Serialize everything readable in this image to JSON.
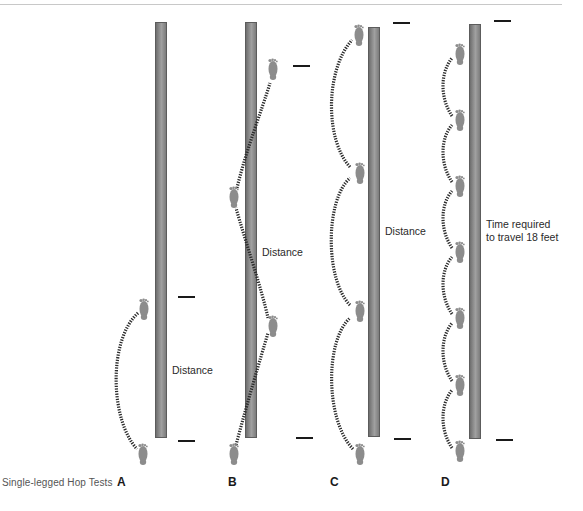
{
  "figure": {
    "caption": "Single-legged Hop Tests",
    "colors": {
      "bar": "#8a8a8a",
      "bar_border": "#5c5c5c",
      "foot": "#8c8c8c",
      "path_dots": "#2a2a2a",
      "tick": "#1a1a1a",
      "header_rule": "#c8c8c8"
    },
    "panels": [
      {
        "letter": "A",
        "test": "single hop",
        "measure_label": "Distance",
        "hops": 1
      },
      {
        "letter": "B",
        "test": "crossover hop",
        "measure_label": "Distance",
        "hops": 3
      },
      {
        "letter": "C",
        "test": "triple hop",
        "measure_label": "Distance",
        "hops": 3
      },
      {
        "letter": "D",
        "test": "timed hop",
        "measure_label_line1": "Time required",
        "measure_label_line2": "to travel 18 feet",
        "hops": 6
      }
    ],
    "icons": {
      "foot": "footprint-icon",
      "path": "dotted-arc-path",
      "marker": "tick-mark"
    }
  }
}
